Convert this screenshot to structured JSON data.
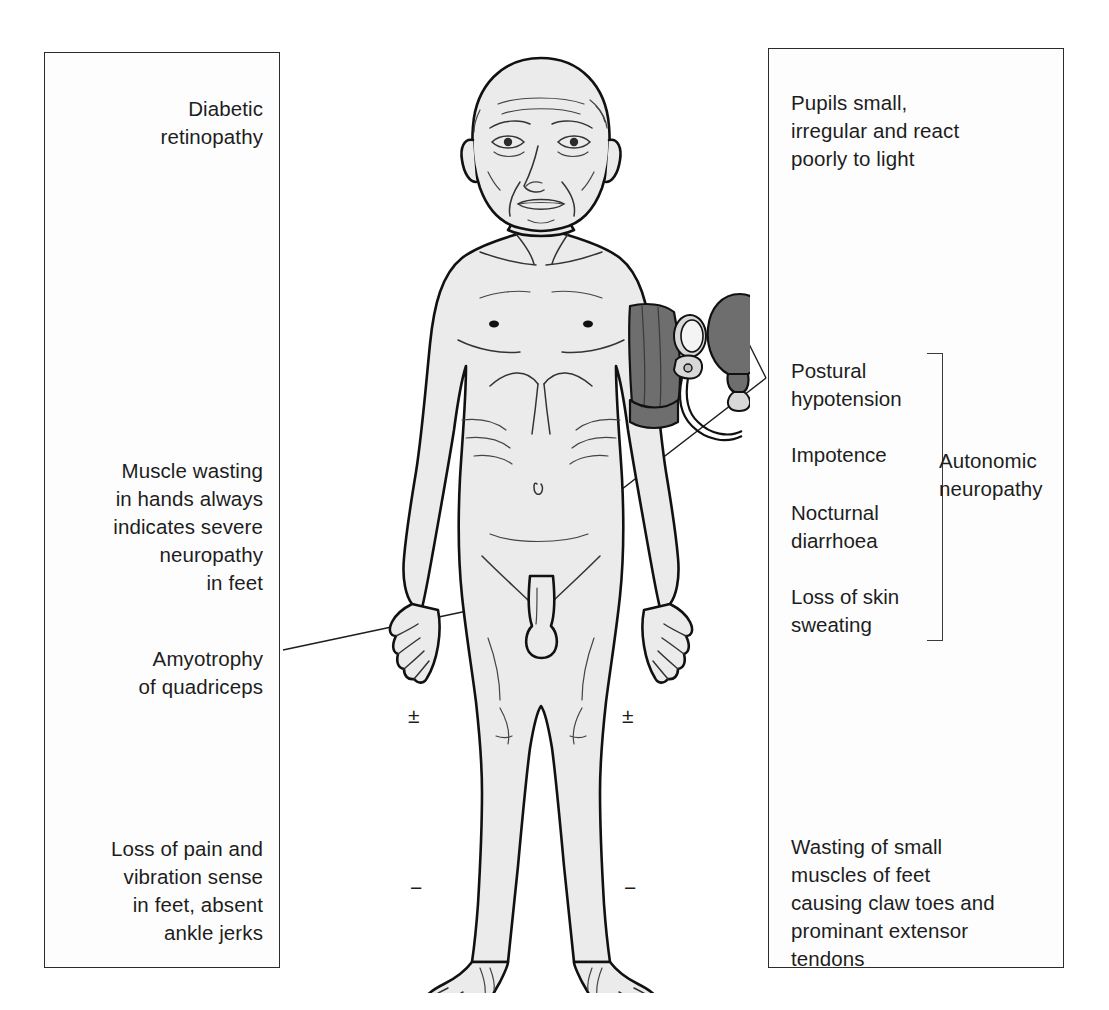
{
  "figure": {
    "skin_fill": "#ebebeb",
    "outline_color": "#111111",
    "cuff_fill": "#6e6e6e",
    "panel_border": "#2b2b2b"
  },
  "left_panel": {
    "notes": [
      {
        "id": "retinopathy",
        "text": "Diabetic\nretinopathy"
      },
      {
        "id": "muscle-wasting",
        "text": "Muscle wasting\nin hands always\nindicates severe\nneuropathy\nin feet"
      },
      {
        "id": "amyotrophy",
        "text": "Amyotrophy\nof quadriceps"
      },
      {
        "id": "loss-of-pain",
        "text": "Loss of pain and\nvibration sense\nin feet, absent\nankle jerks"
      }
    ]
  },
  "right_panel": {
    "notes": [
      {
        "id": "pupils",
        "text": "Pupils small,\nirregular and react\npoorly to light"
      },
      {
        "id": "wasting-feet",
        "text": "Wasting of small\nmuscles of feet\ncausing claw toes and\nprominant extensor\ntendons"
      }
    ],
    "autonomic_group": {
      "label": "Autonomic\nneuropathy",
      "items": [
        "Postural\nhypotension",
        "Impotence",
        "Nocturnal\ndiarrhoea",
        "Loss of skin\nsweating"
      ]
    }
  },
  "reflex_marks": {
    "knee_left": "±",
    "knee_right": "±",
    "ankle_left": "−",
    "ankle_right": "−"
  },
  "equipment": {
    "blood_pressure_cuff": "sphygmomanometer cuff on left upper arm with gauge and inflation bulb"
  }
}
